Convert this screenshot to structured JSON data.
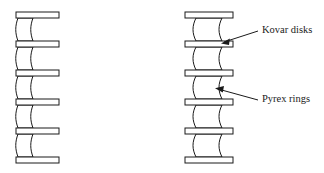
{
  "figure": {
    "background_color": "#ffffff",
    "line_color": "#1a1a1a",
    "fill_color": "#ffffff",
    "width": 324,
    "height": 173
  },
  "stacks": [
    {
      "id": "left-stack",
      "name": "left-assembly",
      "style": "one-sided-flanges",
      "disk_count": 6,
      "ring_count": 5,
      "disks": [
        {
          "x": 16,
          "y": 12,
          "w": 43,
          "h": 6
        },
        {
          "x": 16,
          "y": 41,
          "w": 43,
          "h": 6
        },
        {
          "x": 16,
          "y": 70,
          "w": 43,
          "h": 6
        },
        {
          "x": 16,
          "y": 99,
          "w": 43,
          "h": 6
        },
        {
          "x": 16,
          "y": 128,
          "w": 43,
          "h": 6
        },
        {
          "x": 16,
          "y": 157,
          "w": 43,
          "h": 6
        }
      ],
      "rings": [
        {
          "top": 18,
          "bottom": 41
        },
        {
          "top": 47,
          "bottom": 70
        },
        {
          "top": 76,
          "bottom": 99
        },
        {
          "top": 105,
          "bottom": 128
        },
        {
          "top": 134,
          "bottom": 157
        }
      ],
      "ring_left_x": 18,
      "ring_right_x": 33,
      "ring_waist_inset": 3
    },
    {
      "id": "right-stack",
      "name": "right-assembly",
      "style": "two-sided-flanges",
      "disk_count": 6,
      "ring_count": 5,
      "disks": [
        {
          "x": 185,
          "y": 12,
          "w": 48,
          "h": 6
        },
        {
          "x": 185,
          "y": 41,
          "w": 48,
          "h": 6
        },
        {
          "x": 185,
          "y": 70,
          "w": 48,
          "h": 6
        },
        {
          "x": 185,
          "y": 99,
          "w": 48,
          "h": 6
        },
        {
          "x": 185,
          "y": 128,
          "w": 48,
          "h": 6
        },
        {
          "x": 185,
          "y": 157,
          "w": 48,
          "h": 6
        }
      ],
      "rings": [
        {
          "top": 18,
          "bottom": 41
        },
        {
          "top": 47,
          "bottom": 70
        },
        {
          "top": 76,
          "bottom": 99
        },
        {
          "top": 105,
          "bottom": 128
        },
        {
          "top": 134,
          "bottom": 157
        }
      ],
      "ring_left_x": 196,
      "ring_right_x": 222,
      "ring_waist_inset": 4
    }
  ],
  "annotations": [
    {
      "id": "kovar-disks",
      "label": "Kovar disks",
      "text_x": 262,
      "text_y": 31,
      "leader_from_x": 258,
      "leader_from_y": 31,
      "leader_to_x": 222,
      "leader_to_y": 43,
      "arrow_angle_deg": 162,
      "target": "disk"
    },
    {
      "id": "pyrex-rings",
      "label": "Pyrex rings",
      "text_x": 262,
      "text_y": 100,
      "leader_from_x": 258,
      "leader_from_y": 100,
      "leader_to_x": 216,
      "leader_to_y": 88,
      "arrow_angle_deg": 196,
      "target": "ring"
    }
  ]
}
